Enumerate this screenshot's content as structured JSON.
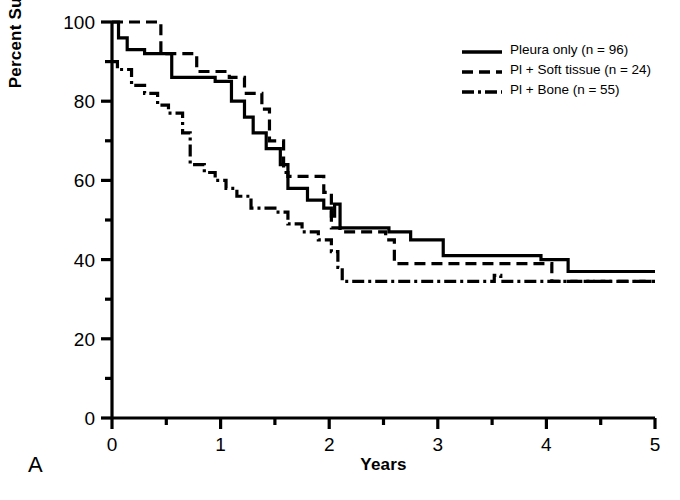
{
  "panel": {
    "label": "A"
  },
  "legend": {
    "position": "top-right",
    "entries": [
      {
        "label": "Pleura only (n = 96)",
        "style": "solid",
        "key_name": "legend-key-solid"
      },
      {
        "label": "Pl + Soft tissue (n = 24)",
        "style": "dashed",
        "key_name": "legend-key-dashed"
      },
      {
        "label": "Pl + Bone (n = 55)",
        "style": "dashdot",
        "key_name": "legend-key-dashdot"
      }
    ]
  },
  "chart_data": {
    "type": "line",
    "subtype": "kaplan-meier-step",
    "title": "",
    "xlabel": "Years",
    "ylabel": "Percent Survival",
    "xlim": [
      0,
      5
    ],
    "ylim": [
      0,
      100
    ],
    "xticks": [
      0,
      1,
      2,
      3,
      4,
      5
    ],
    "xtick_labels": [
      "0",
      "1",
      "2",
      "3",
      "4",
      "5"
    ],
    "xminor_ticks": [
      0.5,
      1.5,
      2.5,
      3.5,
      4.5
    ],
    "yticks": [
      0,
      20,
      40,
      60,
      80,
      100
    ],
    "ytick_labels": [
      "0",
      "20",
      "40",
      "60",
      "80",
      "100"
    ],
    "yminor_ticks": [
      10,
      30,
      50,
      70,
      90
    ],
    "grid": false,
    "line_color": "#000000",
    "series": [
      {
        "name": "Pleura only (n = 96)",
        "n": 96,
        "style": "solid",
        "points": [
          [
            0.0,
            100
          ],
          [
            0.06,
            100
          ],
          [
            0.06,
            96
          ],
          [
            0.14,
            96
          ],
          [
            0.14,
            93
          ],
          [
            0.3,
            93
          ],
          [
            0.3,
            92
          ],
          [
            0.55,
            92
          ],
          [
            0.55,
            86
          ],
          [
            0.95,
            86
          ],
          [
            0.95,
            85
          ],
          [
            1.1,
            85
          ],
          [
            1.1,
            80
          ],
          [
            1.22,
            80
          ],
          [
            1.22,
            76
          ],
          [
            1.3,
            76
          ],
          [
            1.3,
            72
          ],
          [
            1.42,
            72
          ],
          [
            1.42,
            68
          ],
          [
            1.55,
            68
          ],
          [
            1.55,
            64
          ],
          [
            1.62,
            64
          ],
          [
            1.62,
            58
          ],
          [
            1.8,
            58
          ],
          [
            1.8,
            55
          ],
          [
            1.95,
            55
          ],
          [
            1.95,
            53
          ],
          [
            2.02,
            53
          ],
          [
            2.02,
            51
          ],
          [
            2.05,
            51
          ],
          [
            2.05,
            54
          ],
          [
            2.1,
            54
          ],
          [
            2.1,
            48
          ],
          [
            2.55,
            48
          ],
          [
            2.55,
            47
          ],
          [
            2.75,
            47
          ],
          [
            2.75,
            45
          ],
          [
            3.05,
            45
          ],
          [
            3.05,
            41
          ],
          [
            3.95,
            41
          ],
          [
            3.95,
            40
          ],
          [
            4.2,
            40
          ],
          [
            4.2,
            37
          ],
          [
            5.0,
            37
          ]
        ]
      },
      {
        "name": "Pl + Soft tissue (n = 24)",
        "n": 24,
        "style": "dashed",
        "points": [
          [
            0.0,
            100
          ],
          [
            0.45,
            100
          ],
          [
            0.45,
            92
          ],
          [
            0.78,
            92
          ],
          [
            0.78,
            87.5
          ],
          [
            1.08,
            87.5
          ],
          [
            1.08,
            86
          ],
          [
            1.22,
            86
          ],
          [
            1.22,
            82
          ],
          [
            1.38,
            82
          ],
          [
            1.38,
            78
          ],
          [
            1.45,
            78
          ],
          [
            1.45,
            70
          ],
          [
            1.58,
            70
          ],
          [
            1.58,
            62
          ],
          [
            1.62,
            62
          ],
          [
            1.62,
            61
          ],
          [
            1.95,
            61
          ],
          [
            1.95,
            57
          ],
          [
            2.02,
            57
          ],
          [
            2.02,
            48
          ],
          [
            2.1,
            48
          ],
          [
            2.1,
            47
          ],
          [
            2.52,
            47
          ],
          [
            2.52,
            45
          ],
          [
            2.6,
            45
          ],
          [
            2.6,
            39
          ],
          [
            4.05,
            39
          ],
          [
            4.05,
            34.5
          ],
          [
            5.0,
            34.5
          ]
        ]
      },
      {
        "name": "Pl + Bone (n = 55)",
        "n": 55,
        "style": "dashdot",
        "points": [
          [
            0.0,
            90
          ],
          [
            0.05,
            90
          ],
          [
            0.05,
            88
          ],
          [
            0.18,
            88
          ],
          [
            0.18,
            84
          ],
          [
            0.3,
            84
          ],
          [
            0.3,
            82
          ],
          [
            0.42,
            82
          ],
          [
            0.42,
            79
          ],
          [
            0.52,
            79
          ],
          [
            0.52,
            77
          ],
          [
            0.65,
            77
          ],
          [
            0.65,
            72
          ],
          [
            0.72,
            72
          ],
          [
            0.72,
            64
          ],
          [
            0.85,
            64
          ],
          [
            0.85,
            62
          ],
          [
            0.95,
            62
          ],
          [
            0.95,
            60
          ],
          [
            1.05,
            60
          ],
          [
            1.05,
            58
          ],
          [
            1.15,
            58
          ],
          [
            1.15,
            56
          ],
          [
            1.28,
            56
          ],
          [
            1.28,
            53
          ],
          [
            1.5,
            53
          ],
          [
            1.5,
            52
          ],
          [
            1.62,
            52
          ],
          [
            1.62,
            49
          ],
          [
            1.75,
            49
          ],
          [
            1.75,
            47
          ],
          [
            1.9,
            47
          ],
          [
            1.9,
            45
          ],
          [
            2.02,
            45
          ],
          [
            2.02,
            42
          ],
          [
            2.08,
            42
          ],
          [
            2.08,
            38
          ],
          [
            2.12,
            38
          ],
          [
            2.12,
            34.5
          ],
          [
            3.52,
            34.5
          ],
          [
            3.52,
            36
          ],
          [
            3.58,
            36
          ],
          [
            3.58,
            34.5
          ],
          [
            5.0,
            34.5
          ]
        ]
      }
    ]
  }
}
